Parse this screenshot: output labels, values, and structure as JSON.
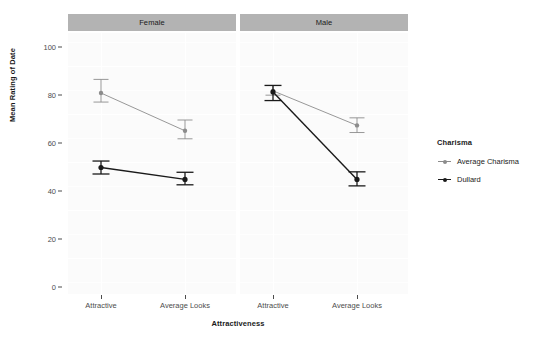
{
  "chart_data": {
    "type": "line",
    "title": "",
    "subtitle": "",
    "xlabel": "Attractiveness",
    "ylabel": "Mean Rating of Date",
    "categories": [
      "Attractive",
      "Average Looks"
    ],
    "ylim": [
      0,
      100
    ],
    "yticks": [
      0,
      20,
      40,
      60,
      80,
      100
    ],
    "yticklabels": [
      "0",
      "20",
      "40",
      "60",
      "80",
      "100"
    ],
    "grid": true,
    "legend_position": "right",
    "legend_title": "Charisma",
    "facet_variable": "Gender",
    "facets": [
      {
        "name": "Female",
        "series": [
          {
            "name": "Average Charisma",
            "color": "#8c8c8c",
            "values": [
              87.5,
              70.0
            ],
            "err_low": [
              83.3,
              66.3
            ],
            "err_high": [
              93.8,
              75.0
            ]
          },
          {
            "name": "Dullard",
            "color": "#1a1a1a",
            "values": [
              53.0,
              47.5
            ],
            "err_low": [
              50.0,
              45.0
            ],
            "err_high": [
              56.0,
              50.8
            ]
          }
        ]
      },
      {
        "name": "Male",
        "series": [
          {
            "name": "Average Charisma",
            "color": "#8c8c8c",
            "values": [
              88.5,
              72.5
            ],
            "err_low": [
              86.5,
              69.2
            ],
            "err_high": [
              91.0,
              76.0
            ]
          },
          {
            "name": "Dullard",
            "color": "#1a1a1a",
            "values": [
              88.0,
              47.5
            ],
            "err_low": [
              84.0,
              44.5
            ],
            "err_high": [
              91.0,
              51.0
            ]
          }
        ]
      }
    ],
    "series_names": [
      "Average Charisma",
      "Dullard"
    ],
    "colors": {
      "average_charisma": "#8c8c8c",
      "dullard": "#1a1a1a",
      "strip_background": "#b3b3b3",
      "panel_background": "#fbfbfb",
      "gridline": "#ffffff",
      "axis_text": "#4d4d4d"
    }
  },
  "legend": {
    "title": "Charisma",
    "items": [
      {
        "label": "Average Charisma",
        "color": "#8c8c8c"
      },
      {
        "label": "Dullard",
        "color": "#1a1a1a"
      }
    ]
  },
  "axes": {
    "y_title": "Mean Rating of Date",
    "x_title": "Attractiveness",
    "y_ticks": [
      "100",
      "80",
      "60",
      "40",
      "20",
      "0"
    ],
    "x_ticks": [
      "Attractive",
      "Average Looks"
    ]
  },
  "facet_strips": [
    {
      "label": "Female"
    },
    {
      "label": "Male"
    }
  ]
}
